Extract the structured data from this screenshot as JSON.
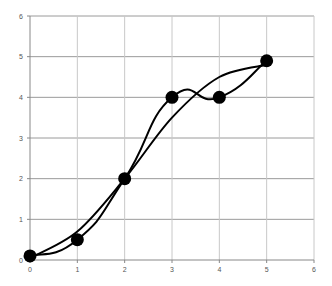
{
  "chart_data": {
    "type": "line",
    "title": "",
    "xlabel": "",
    "ylabel": "",
    "xlim": [
      0,
      6
    ],
    "ylim": [
      0,
      6
    ],
    "grid": true,
    "legend": null,
    "x_ticks": [
      "0",
      "1",
      "2",
      "3",
      "4",
      "5",
      "6"
    ],
    "y_ticks": [
      "0",
      "1",
      "2",
      "3",
      "4",
      "5",
      "6"
    ],
    "points": {
      "x": [
        0,
        1,
        2,
        3,
        4,
        5
      ],
      "y": [
        0.1,
        0.5,
        2,
        4,
        4,
        4.9
      ]
    },
    "series": [
      {
        "name": "interpolating spline",
        "x": [
          0,
          1,
          2,
          3,
          4,
          5
        ],
        "y": [
          0.1,
          0.5,
          2,
          4,
          4,
          4.9
        ],
        "style": "smooth curve through all markers"
      },
      {
        "name": "smooth fit",
        "x": [
          0,
          1,
          2,
          3,
          4,
          5
        ],
        "y": [
          0.05,
          0.7,
          2.0,
          3.5,
          4.5,
          4.8
        ],
        "style": "smooth approximating curve"
      }
    ],
    "marker": "filled circle",
    "colors": {
      "line": "#000000",
      "grid": "#bfbfbf",
      "axis": "#888888"
    }
  }
}
